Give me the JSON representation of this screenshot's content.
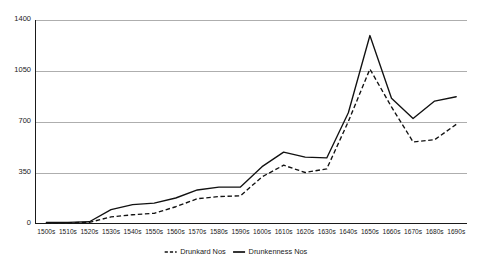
{
  "chart_data": {
    "type": "line",
    "title": "",
    "subtitle": "",
    "xlabel": "",
    "ylabel": "",
    "categories": [
      "1500s",
      "1510s",
      "1520s",
      "1530s",
      "1540s",
      "1550s",
      "1560s",
      "1570s",
      "1580s",
      "1590s",
      "1600s",
      "1610s",
      "1620s",
      "1630s",
      "1640s",
      "1650s",
      "1660s",
      "1670s",
      "1680s",
      "1690s"
    ],
    "series": [
      {
        "name": "Drunkard Nos",
        "style": "dashed",
        "color": "#111111",
        "values": [
          5,
          5,
          8,
          45,
          60,
          70,
          115,
          170,
          185,
          190,
          320,
          400,
          350,
          375,
          700,
          1060,
          800,
          560,
          575,
          680
        ]
      },
      {
        "name": "Drunkenness Nos",
        "style": "solid",
        "color": "#111111",
        "values": [
          8,
          8,
          12,
          95,
          130,
          140,
          175,
          230,
          250,
          250,
          390,
          490,
          455,
          450,
          760,
          1290,
          860,
          720,
          840,
          870
        ]
      }
    ],
    "ylim": [
      0,
      1400
    ],
    "yticks": [
      0,
      350,
      700,
      1050,
      1400
    ],
    "ytick_labels": [
      "0",
      "350",
      "700",
      "1050",
      "1400"
    ],
    "grid": true,
    "grid_axis": "y",
    "legend": {
      "position": "bottom",
      "entries": [
        {
          "label": "Drunkard Nos",
          "style": "dashed"
        },
        {
          "label": "Drunkenness Nos",
          "style": "solid"
        }
      ]
    },
    "colors": {
      "background": "#ffffff",
      "grid": "#8c8c8c",
      "axis": "#1a1a1a",
      "text": "#1a1a1a",
      "series": "#111111"
    }
  }
}
